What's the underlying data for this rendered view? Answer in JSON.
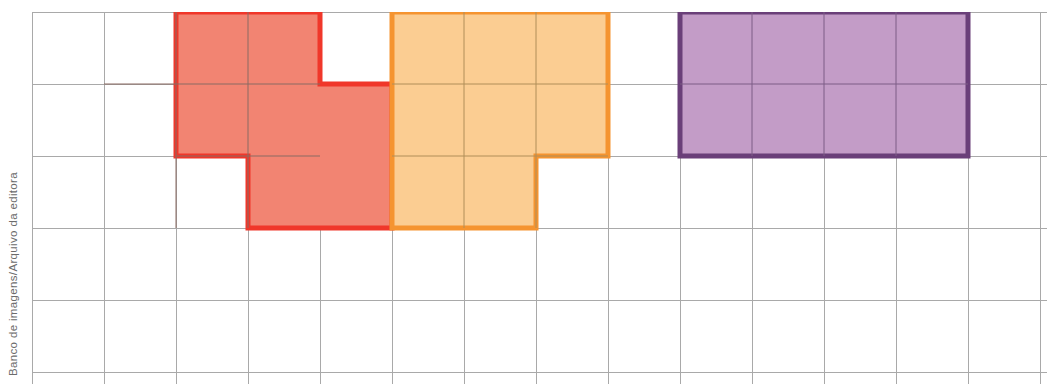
{
  "figure": {
    "credit": "Banco de imagens/Arquivo da editora",
    "background_color": "#ffffff"
  },
  "grid": {
    "cell_size": 72,
    "origin_x": 32,
    "origin_y": 12,
    "columns": 14,
    "rows": 5,
    "line_color": "#a8a8a8",
    "line_width": 1
  },
  "shapes": [
    {
      "name": "red-shape",
      "label": "Figura vermelha",
      "cell_count": 6,
      "fill_color": "#f28472",
      "stroke_color": "#f0372a",
      "stroke_width": 5,
      "cells": [
        [
          1,
          0
        ],
        [
          2,
          0
        ],
        [
          1,
          1
        ],
        [
          2,
          1
        ],
        [
          3,
          1
        ],
        [
          2,
          2
        ],
        [
          3,
          2
        ]
      ],
      "outline_points": "72,0 216,0 216,72 288,72 288,216 144,216 144,144 72,144"
    },
    {
      "name": "orange-shape",
      "label": "Figura laranja",
      "cell_count": 8,
      "fill_color": "#fbcd92",
      "stroke_color": "#f59430",
      "stroke_width": 5,
      "cells": [
        [
          5,
          0
        ],
        [
          6,
          0
        ],
        [
          7,
          0
        ],
        [
          5,
          1
        ],
        [
          6,
          1
        ],
        [
          7,
          1
        ],
        [
          5,
          2
        ],
        [
          6,
          2
        ]
      ],
      "outline_points": "0,0 216,0 216,144 144,144 144,216 0,216"
    },
    {
      "name": "purple-shape",
      "label": "Figura roxa",
      "cell_count": 8,
      "fill_color": "#c39cc7",
      "stroke_color": "#6a3f79",
      "stroke_width": 5,
      "cells": [
        [
          9,
          0
        ],
        [
          10,
          0
        ],
        [
          11,
          0
        ],
        [
          12,
          0
        ],
        [
          9,
          1
        ],
        [
          10,
          1
        ],
        [
          11,
          1
        ],
        [
          12,
          1
        ]
      ],
      "outline_points": "0,0 288,0 288,144 0,144"
    }
  ]
}
